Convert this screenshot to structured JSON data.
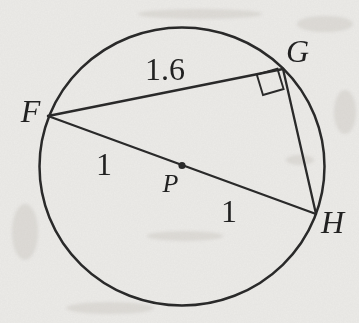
{
  "figure": {
    "kind": "circle-geometry-diagram",
    "circle_center_label": "P",
    "point_labels": [
      "F",
      "G",
      "H"
    ],
    "measurements": {
      "chord_FG": "1.6",
      "segment_FP": "1",
      "segment_PH": "1"
    },
    "right_angle_at": "G"
  },
  "labels": {
    "F": "F",
    "G": "G",
    "H": "H",
    "P": "P",
    "fg_length": "1.6",
    "fp_length": "1",
    "ph_length": "1"
  },
  "colors": {
    "background": "#ecebe8",
    "line": "#272727",
    "text": "#1e1e1e"
  },
  "geometry": {
    "circle": {
      "cx": 182,
      "cy": 166.5,
      "rx": 142.5,
      "ry": 139
    },
    "points": {
      "F": {
        "x": 48,
        "y": 116
      },
      "G": {
        "x": 283,
        "y": 69
      },
      "H": {
        "x": 316,
        "y": 214
      },
      "P": {
        "x": 182,
        "y": 165.5,
        "r": 3.6
      }
    },
    "right_angle_marker_points": "277.4,68.6 283.6,89 263,95 256.8,74.6",
    "label_positions": {
      "F": {
        "x": 30.5,
        "y": 121.5
      },
      "G": {
        "x": 297.5,
        "y": 61.5
      },
      "H": {
        "x": 332.5,
        "y": 233
      },
      "P": {
        "x": 170.5,
        "y": 191.5
      },
      "fg": {
        "x": 165,
        "y": 80
      },
      "fp": {
        "x": 104,
        "y": 175
      },
      "ph": {
        "x": 229,
        "y": 222
      }
    }
  }
}
